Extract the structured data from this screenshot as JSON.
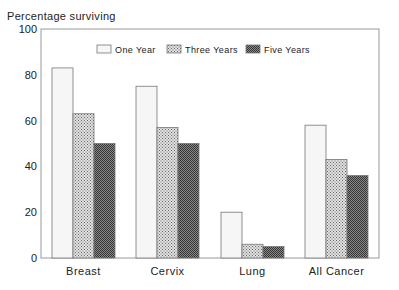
{
  "chart_data": {
    "type": "bar",
    "title": "",
    "xlabel": "",
    "ylabel": "Percentage surviving",
    "ylim": [
      0,
      100
    ],
    "yticks": [
      0,
      20,
      40,
      60,
      80,
      100
    ],
    "grid": false,
    "legend_position": "top-inside",
    "categories": [
      "Breast",
      "Cervix",
      "Lung",
      "All Cancer"
    ],
    "series": [
      {
        "name": "One Year",
        "values": [
          83,
          75,
          20,
          58
        ],
        "fill": "#f4f4f4"
      },
      {
        "name": "Three Years",
        "values": [
          63,
          57,
          6,
          43
        ],
        "fill": "#b8b8b8"
      },
      {
        "name": "Five Years",
        "values": [
          50,
          50,
          5,
          36
        ],
        "fill": "#6a6a6a"
      }
    ]
  }
}
